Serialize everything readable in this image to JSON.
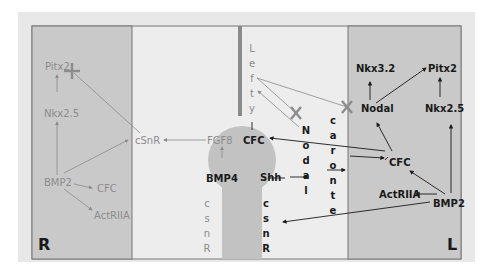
{
  "diagram": {
    "side_labels": {
      "right": "R",
      "left": "L"
    },
    "colors": {
      "outer_bg": "#e8e8e8",
      "side_panel": "#c9c9c9",
      "center_bg": "#ececec",
      "node_shape": "#c2c2c2",
      "midline": "#8a8a8a",
      "grey_text": "#8c8c8c",
      "dark_text": "#1a1a1a"
    },
    "right_side": {
      "nodes": [
        "Pitx2",
        "Nkx2.5",
        "BMP2",
        "CFC",
        "ActRIIA",
        "cSnR"
      ]
    },
    "midline": {
      "lefty": "Lefty",
      "nodal": "Nodal",
      "caronte": "caronte",
      "csnr_left": "csnR",
      "csnr_right": "csnR",
      "node": [
        "FGF8",
        "CFC",
        "BMP4",
        "Shh"
      ]
    },
    "left_side": {
      "nodes": [
        "Nkx3.2",
        "Pitx2",
        "Nodal",
        "Nkx2.5",
        "CFC",
        "ActRIIA",
        "BMP2"
      ]
    },
    "labels": {
      "r_pitx2": "Pitx2",
      "r_nkx25": "Nkx2.5",
      "r_bmp2": "BMP2",
      "r_cfc": "CFC",
      "r_actriia": "ActRIIA",
      "r_csnr": "cSnR",
      "fgf8": "FGF8",
      "node_cfc": "CFC",
      "bmp4": "BMP4",
      "shh": "Shh",
      "l_nkx32": "Nkx3.2",
      "l_pitx2": "Pitx2",
      "l_nodal": "Nodal",
      "l_nkx25": "Nkx2.5",
      "l_cfc": "CFC",
      "l_actriia": "ActRIIA",
      "l_bmp2": "BMP2"
    },
    "vertical_words": {
      "lefty": [
        "L",
        "e",
        "f",
        "t",
        "y"
      ],
      "nodal": [
        "N",
        "o",
        "d",
        "a",
        "l"
      ],
      "caronte": [
        "c",
        "a",
        "r",
        "o",
        "n",
        "t",
        "e"
      ],
      "csnr_grey": [
        "c",
        "s",
        "n",
        "R"
      ],
      "csnr_dark": [
        "c",
        "s",
        "n",
        "R"
      ]
    }
  }
}
